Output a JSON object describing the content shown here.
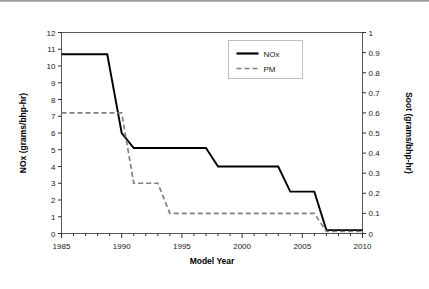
{
  "chart_data": {
    "type": "line",
    "title": "",
    "xlabel": "Model Year",
    "ylabel": "NOx (grams/bhp-hr)",
    "y2label": "Soot (grams/bhp-hr)",
    "xlim": [
      1985,
      2010
    ],
    "ylim": [
      0,
      12
    ],
    "y2lim": [
      0,
      1
    ],
    "xticks": [
      1985,
      1990,
      1995,
      2000,
      2005,
      2010
    ],
    "xtick_labels": [
      "1985",
      "1990",
      "1995",
      "2000",
      "2005",
      "2010"
    ],
    "xminor_step": 1,
    "yticks": [
      0,
      1,
      2,
      3,
      4,
      5,
      6,
      7,
      8,
      9,
      10,
      11,
      12
    ],
    "ytick_labels": [
      "0",
      "1",
      "2",
      "3",
      "4",
      "5",
      "6",
      "7",
      "8",
      "9",
      "10",
      "11",
      "12"
    ],
    "y2ticks": [
      0,
      0.1,
      0.2,
      0.3,
      0.4,
      0.5,
      0.6,
      0.7,
      0.8,
      0.9,
      1
    ],
    "y2tick_labels": [
      "0",
      "0.1",
      "0.2",
      "0.3",
      "0.4",
      "0.5",
      "0.6",
      "0.7",
      "0.8",
      "0.9",
      "1"
    ],
    "grid": false,
    "legend_position": "top-center",
    "series": [
      {
        "name": "NOx",
        "axis": "left",
        "style": "solid",
        "color": "#000000",
        "unit": "grams/bhp-hr",
        "points": [
          {
            "x": 1985,
            "y": 10.7
          },
          {
            "x": 1988.8,
            "y": 10.7
          },
          {
            "x": 1990,
            "y": 6.0
          },
          {
            "x": 1991,
            "y": 5.1
          },
          {
            "x": 1997,
            "y": 5.1
          },
          {
            "x": 1998,
            "y": 4.0
          },
          {
            "x": 2003,
            "y": 4.0
          },
          {
            "x": 2004,
            "y": 2.5
          },
          {
            "x": 2006,
            "y": 2.5
          },
          {
            "x": 2007,
            "y": 0.2
          },
          {
            "x": 2010,
            "y": 0.2
          }
        ]
      },
      {
        "name": "PM",
        "axis": "right",
        "style": "dashed",
        "color": "#808080",
        "unit": "grams/bhp-hr",
        "points": [
          {
            "x": 1985,
            "y": 0.6
          },
          {
            "x": 1990,
            "y": 0.6
          },
          {
            "x": 1991,
            "y": 0.25
          },
          {
            "x": 1993,
            "y": 0.25
          },
          {
            "x": 1994,
            "y": 0.1
          },
          {
            "x": 2006,
            "y": 0.1
          },
          {
            "x": 2007,
            "y": 0.01
          },
          {
            "x": 2010,
            "y": 0.01
          }
        ]
      }
    ],
    "legend": [
      {
        "label": "NOx",
        "style": "solid",
        "color": "#000000"
      },
      {
        "label": "PM",
        "style": "dashed",
        "color": "#808080"
      }
    ]
  }
}
